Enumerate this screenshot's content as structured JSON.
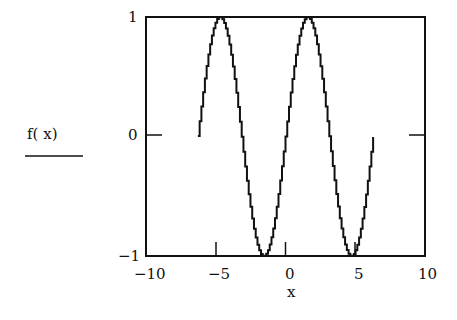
{
  "chart_data": {
    "type": "line",
    "title": "",
    "xlabel": "x",
    "ylabel": "f( x)",
    "xlim": [
      -10,
      10
    ],
    "ylim": [
      -1,
      1
    ],
    "x_ticks": [
      "-10",
      "-5",
      "0",
      "5",
      "10"
    ],
    "y_ticks": [
      "1",
      "0",
      "-1"
    ],
    "grid": false,
    "series": [
      {
        "name": "f(x)",
        "function": "sin(x)",
        "x_range": [
          -6.28,
          6.28
        ],
        "x": [
          -6.28,
          -4.71,
          -3.14,
          -1.57,
          0,
          1.57,
          3.14,
          4.71,
          6.28
        ],
        "values": [
          0,
          1,
          0,
          -1,
          0,
          1,
          0,
          -1,
          0
        ]
      }
    ]
  }
}
